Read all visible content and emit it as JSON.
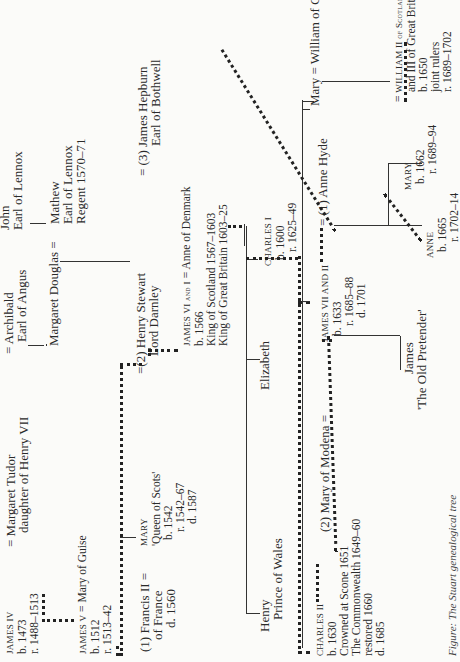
{
  "caption": "Figure: The Stuart genealogical tree",
  "people": {
    "james_iv": {
      "name": "JAMES IV",
      "born": "b. 1473",
      "reign": "r. 1488–1513"
    },
    "margaret_tudor": {
      "name": "= Margaret Tudor",
      "note": "daughter of Henry VII"
    },
    "archibald": {
      "name": "= Archibald",
      "title": "Earl of Angus"
    },
    "john_lennox": {
      "name": "John",
      "title": "Earl of Lennox"
    },
    "margaret_douglas": {
      "name": "Margaret Douglas",
      "eq": "="
    },
    "mathew": {
      "name": "Mathew",
      "title": "Earl of Lennox",
      "note": "Regent 1570–71"
    },
    "james_v": {
      "name": "JAMES V",
      "spouse": "= Mary of Guise",
      "born": "b. 1512",
      "reign": "r. 1513–42"
    },
    "mary_qos": {
      "name": "MARY",
      "epithet": "'Queen of Scots'",
      "born": "b. 1542",
      "reign": "r. 1542–67",
      "died": "d. 1587"
    },
    "francis_ii": {
      "name": "(1) Francis II =",
      "title": "of France",
      "died": "d. 1560"
    },
    "darnley": {
      "name": "(2) Henry Stewart",
      "title": "Lord Darnley",
      "eq": "="
    },
    "bothwell": {
      "name": "= (3) James Hepburn",
      "title": "Earl of Bothwell"
    },
    "james_vi": {
      "name": "JAMES VI and I",
      "spouse": "= Anne of Denmark",
      "born": "b. 1566",
      "line1": "King of Scotland 1567–1603",
      "line2": "King of Great Britain 1603–25"
    },
    "henry": {
      "name": "Henry",
      "title": "Prince of Wales"
    },
    "elizabeth": {
      "name": "Elizabeth"
    },
    "charles_i": {
      "name": "CHARLES I",
      "born": "b. 1600",
      "reign": "r. 1625–49"
    },
    "charles_ii": {
      "name": "CHARLES II",
      "born": "b. 1630",
      "line1": "Crowned at Scone 1651",
      "line2": "The Commonwealth 1649–60",
      "line3": "restored 1660",
      "died": "d. 1685"
    },
    "mary_modena": {
      "name": "(2) Mary of Modena",
      "eq": "="
    },
    "james_vii": {
      "name": "JAMES VII AND II",
      "born": "b. 1633",
      "reign": "r. 1685–88",
      "died": "d. 1701"
    },
    "anne_hyde": {
      "name": "= (1) Anne Hyde"
    },
    "mary_orange": {
      "name": "Mary =",
      "spouse": "William of Orange"
    },
    "old_pretender": {
      "name": "James",
      "epithet": "'The Old Pretender'"
    },
    "mary_ii": {
      "name": "MARY",
      "born": "b. 1662",
      "reign": "r. 1689–94"
    },
    "anne": {
      "name": "ANNE",
      "born": "b. 1665",
      "reign": "r. 1702–14"
    },
    "william": {
      "name": "WILLIAM II of Scotland",
      "line1": "and III of Great Britain",
      "born": "b. 1650",
      "note": "joint rulers",
      "reign": "r. 1689–1702",
      "eq": "="
    }
  }
}
